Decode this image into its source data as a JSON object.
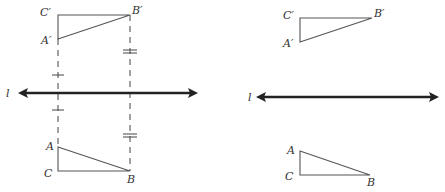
{
  "figures": [
    {
      "name": "left-construction",
      "line": {
        "label": "l",
        "x1": 18,
        "x2": 197,
        "y": 93
      },
      "triangle_image": {
        "vertices": {
          "C'": [
            58,
            15
          ],
          "B'": [
            130,
            15
          ],
          "A'": [
            58,
            39
          ]
        },
        "labels": {
          "C": "C′",
          "B": "B′",
          "A": "A′"
        }
      },
      "triangle_preimage": {
        "vertices": {
          "A": [
            58,
            147
          ],
          "C": [
            58,
            171
          ],
          "B": [
            130,
            171
          ]
        },
        "labels": {
          "A": "A",
          "C": "C",
          "B": "B"
        }
      },
      "perpendiculars": [
        {
          "x": 58,
          "y1": 39,
          "y2": 147,
          "tick_marks": 1
        },
        {
          "x": 130,
          "y1": 15,
          "y2": 171,
          "tick_marks": 2
        }
      ]
    },
    {
      "name": "right-result",
      "line": {
        "label": "l",
        "x1": 257,
        "x2": 438,
        "y": 97
      },
      "triangle_image": {
        "vertices": {
          "C'": [
            300,
            18
          ],
          "B'": [
            372,
            18
          ],
          "A'": [
            300,
            42
          ]
        },
        "labels": {
          "C": "C′",
          "B": "B′",
          "A": "A′"
        }
      },
      "triangle_preimage": {
        "vertices": {
          "A": [
            300,
            151
          ],
          "C": [
            300,
            175
          ],
          "B": [
            370,
            175
          ]
        },
        "labels": {
          "A": "A",
          "C": "C",
          "B": "B"
        }
      }
    }
  ],
  "labels": {
    "left_line": "l",
    "left_Cp": "C′",
    "left_Bp": "B′",
    "left_Ap": "A′",
    "left_A": "A",
    "left_C": "C",
    "left_B": "B",
    "right_line": "l",
    "right_Cp": "C′",
    "right_Bp": "B′",
    "right_Ap": "A′",
    "right_A": "A",
    "right_C": "C",
    "right_B": "B"
  }
}
